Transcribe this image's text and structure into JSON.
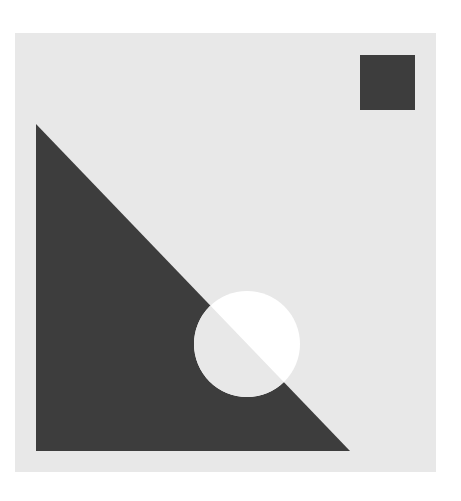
{
  "artwork": {
    "description": "Abstract geometric composition",
    "colors": {
      "page_background": "#ffffff",
      "panel": "#e8e8e8",
      "dark_shape": "#3d3d3d",
      "circle_outside_triangle": "#ffffff",
      "circle_inside_triangle": "#e8e8e8"
    },
    "shapes": [
      {
        "kind": "panel",
        "name": "background-panel"
      },
      {
        "kind": "square",
        "name": "dark-square"
      },
      {
        "kind": "right-triangle",
        "name": "dark-triangle"
      },
      {
        "kind": "circle",
        "name": "inverted-circle",
        "effect": "inverts colors where it overlaps the triangle"
      }
    ]
  }
}
